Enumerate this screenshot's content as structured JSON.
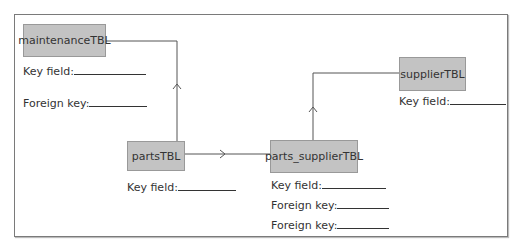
{
  "tables": {
    "maintenance": {
      "name": "maintenanceTBL",
      "fields": [
        {
          "label": "Key field:"
        },
        {
          "label": "Foreign key:"
        }
      ]
    },
    "parts": {
      "name": "partsTBL",
      "fields": [
        {
          "label": "Key field:"
        }
      ]
    },
    "parts_supplier": {
      "name": "parts_supplierTBL",
      "fields": [
        {
          "label": "Key field:"
        },
        {
          "label": "Foreign key:"
        },
        {
          "label": "Foreign key:"
        }
      ]
    },
    "supplier": {
      "name": "supplierTBL",
      "fields": [
        {
          "label": "Key field:"
        }
      ]
    }
  },
  "relationships": [
    {
      "from": "partsTBL",
      "to": "maintenanceTBL"
    },
    {
      "from": "partsTBL",
      "to": "parts_supplierTBL"
    },
    {
      "from": "parts_supplierTBL",
      "to": "supplierTBL"
    }
  ],
  "colors": {
    "box_fill": "#c3c3c3",
    "box_border": "#999999",
    "line": "#555555"
  }
}
